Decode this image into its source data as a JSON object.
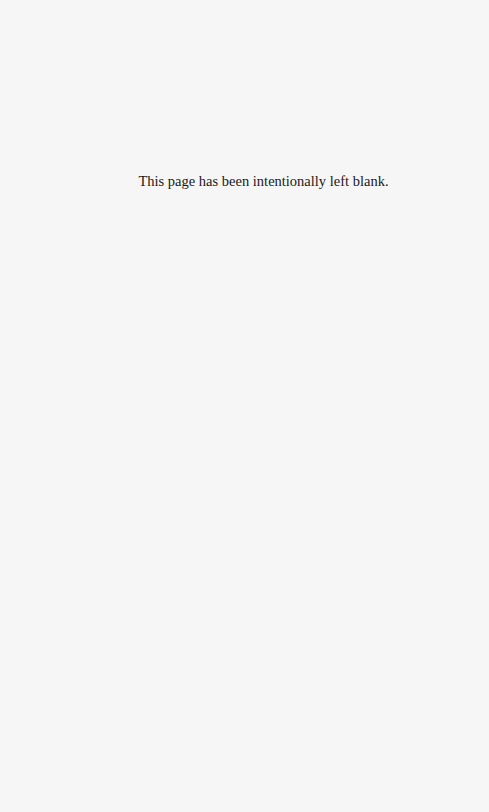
{
  "page": {
    "background": "#f6f6f6",
    "notice": "This page has been intentionally left blank."
  }
}
